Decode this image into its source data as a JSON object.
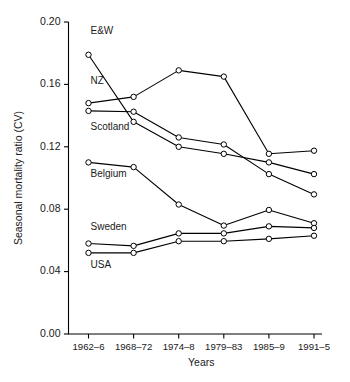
{
  "chart_data": {
    "type": "line",
    "title": "",
    "xlabel": "Years",
    "ylabel": "Seasonal mortality ratio (CV)",
    "categories": [
      "1962–6",
      "1968–72",
      "1974–8",
      "1979–83",
      "1985–9",
      "1991–5"
    ],
    "ylim": [
      0.0,
      0.2
    ],
    "yticks": [
      0.0,
      0.04,
      0.08,
      0.12,
      0.16,
      0.2
    ],
    "ytick_labels": [
      "0.00",
      "0.04",
      "0.08",
      "0.12",
      "0.16",
      "0.20"
    ],
    "grid": false,
    "legend_position": "inline-labels",
    "marker": "open-circle",
    "line_color": "#000000",
    "marker_fill": "#ffffff",
    "series": [
      {
        "name": "E&W",
        "label": "E&W",
        "label_anchor_index": 0,
        "values": [
          0.179,
          0.136,
          0.12,
          0.1155,
          0.11,
          0.1025
        ]
      },
      {
        "name": "NZ",
        "label": "NZ",
        "label_anchor_index": 0,
        "values": [
          0.148,
          0.152,
          0.169,
          0.165,
          0.1155,
          0.1175
        ]
      },
      {
        "name": "Scotland",
        "label": "Scotland",
        "label_anchor_index": 0,
        "values": [
          0.143,
          0.1425,
          0.126,
          0.1215,
          0.1025,
          0.0895
        ]
      },
      {
        "name": "Belgium",
        "label": "Belgium",
        "label_anchor_index": 0,
        "values": [
          0.11,
          0.107,
          0.083,
          0.0695,
          0.0795,
          0.071
        ]
      },
      {
        "name": "Sweden",
        "label": "Sweden",
        "label_anchor_index": 0,
        "values": [
          0.058,
          0.0565,
          0.0645,
          0.0645,
          0.069,
          0.068
        ]
      },
      {
        "name": "USA",
        "label": "USA",
        "label_anchor_index": 0,
        "values": [
          0.052,
          0.052,
          0.0595,
          0.0595,
          0.061,
          0.063
        ]
      }
    ],
    "series_label_positions": [
      {
        "name": "E&W",
        "x": 0.0,
        "y": 0.1925
      },
      {
        "name": "NZ",
        "x": 0.0,
        "y": 0.1605
      },
      {
        "name": "Scotland",
        "x": 0.0,
        "y": 0.1305
      },
      {
        "name": "Belgium",
        "x": 0.0,
        "y": 0.1005
      },
      {
        "name": "Sweden",
        "x": 0.0,
        "y": 0.0665
      },
      {
        "name": "USA",
        "x": 0.0,
        "y": 0.0425
      }
    ]
  }
}
